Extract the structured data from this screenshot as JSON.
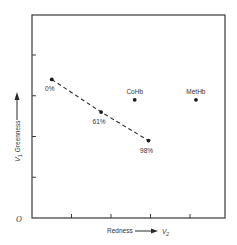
{
  "chart_data": {
    "type": "scatter",
    "title": "",
    "xlabel": "Redness",
    "xlabel_var": "V",
    "xlabel_sub": "2",
    "ylabel": "Greenness",
    "ylabel_var": "V",
    "ylabel_sub": "1",
    "origin_label": "O",
    "xlim": [
      0,
      4.9
    ],
    "ylim": [
      0,
      5.0
    ],
    "x_ticks": [
      1,
      2,
      3,
      4
    ],
    "y_ticks": [
      1,
      2,
      3,
      4
    ],
    "tick_labels_shown": false,
    "grid": false,
    "legend": null,
    "series": [
      {
        "name": "Oxyhemoglobin saturation line",
        "style": "dashed-line-with-markers",
        "points": [
          {
            "label": "0%",
            "x": 0.5,
            "y": 3.4
          },
          {
            "label": "61%",
            "x": 1.75,
            "y": 2.6
          },
          {
            "label": "98%",
            "x": 2.95,
            "y": 1.9
          }
        ]
      },
      {
        "name": "Other hemoglobin species",
        "style": "markers",
        "points": [
          {
            "label": "CoHb",
            "x": 2.6,
            "y": 2.9
          },
          {
            "label": "MetHb",
            "x": 4.15,
            "y": 2.9
          }
        ]
      }
    ],
    "colors": {
      "ink": "#2a2a2a",
      "frame": "#3a3a3a",
      "background": "#ffffff"
    }
  }
}
